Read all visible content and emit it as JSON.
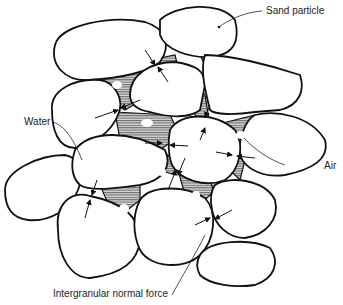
{
  "diagram": {
    "title": "",
    "labels": {
      "sand_particle": "Sand particle",
      "water": "Water",
      "air": "Air",
      "intergranular_force": "Intergranular normal force"
    },
    "elements": {
      "grains": "sand particles (white irregular shapes)",
      "pores": "water-filled pore spaces (hatched)",
      "bubbles": "air bubbles (white spots within water)",
      "forces": "intergranular normal force arrows at contact points"
    }
  }
}
